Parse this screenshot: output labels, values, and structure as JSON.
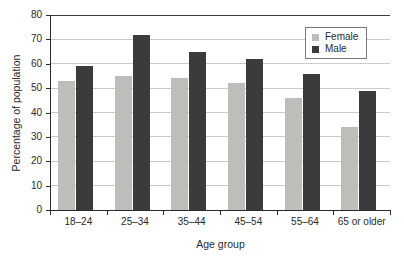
{
  "chart": {
    "ylabel": "Percentage of population",
    "xlabel": "Age group"
  },
  "chart_data": {
    "type": "bar",
    "title": "",
    "xlabel": "Age group",
    "ylabel": "Percentage of population",
    "categories": [
      "18–24",
      "25–34",
      "35–44",
      "45–54",
      "55–64",
      "65 or older"
    ],
    "series": [
      {
        "name": "Female",
        "color": "#bcbfb9",
        "values": [
          53,
          55,
          54,
          52,
          46,
          34
        ]
      },
      {
        "name": "Male",
        "color": "#3a3b3d",
        "values": [
          59,
          72,
          65,
          62,
          56,
          49
        ]
      }
    ],
    "ylim": [
      0,
      80
    ],
    "ytick_step": 10,
    "grid": true,
    "legend_position": "top-right",
    "colors": {
      "gridline": "#c9cbc8",
      "top_border": "#3c3c3c",
      "axis": "#2a2a2a",
      "text": "#2a2a2a"
    }
  }
}
